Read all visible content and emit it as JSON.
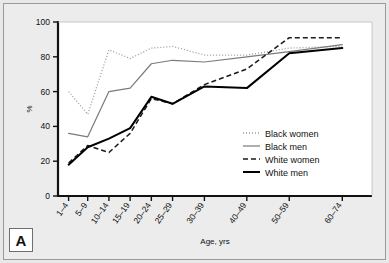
{
  "figure": {
    "panel_label": "A",
    "background_color": "#ececec",
    "plot_background_color": "#ffffff"
  },
  "chart_data": {
    "type": "line",
    "title": "",
    "xlabel": "Age, yrs",
    "ylabel": "%",
    "categories": [
      "1–4",
      "5–9",
      "10–14",
      "15–19",
      "20–24",
      "25–29",
      "30–39",
      "40–49",
      "50–59",
      "60–74"
    ],
    "x_positions": [
      2.5,
      7,
      12,
      17,
      22,
      27,
      34.5,
      44.5,
      54.5,
      67
    ],
    "xlim": [
      0,
      74
    ],
    "ylim": [
      0,
      100
    ],
    "yticks": [
      0,
      20,
      40,
      60,
      80,
      100
    ],
    "grid": false,
    "legend_position": "inside-right",
    "series": [
      {
        "name": "Black women",
        "style": "dotted",
        "color": "#9b9b9b",
        "width": 1.3,
        "values": [
          60,
          47,
          84,
          79,
          85,
          86,
          81,
          81,
          85,
          86
        ]
      },
      {
        "name": "Black men",
        "style": "solid-thin",
        "color": "#7a7a7a",
        "width": 1.2,
        "values": [
          36,
          34,
          60,
          62,
          76,
          78,
          77,
          80,
          83,
          87
        ]
      },
      {
        "name": "White women",
        "style": "dashed",
        "color": "#1a1a1a",
        "width": 1.5,
        "values": [
          19,
          29,
          25,
          36,
          56,
          53,
          64,
          73,
          91,
          91
        ]
      },
      {
        "name": "White men",
        "style": "solid-thick",
        "color": "#000000",
        "width": 2.0,
        "values": [
          18,
          28,
          33,
          39,
          57,
          53,
          63,
          62,
          82,
          85
        ]
      }
    ]
  },
  "legend": {
    "items": [
      {
        "label": "Black women"
      },
      {
        "label": "Black men"
      },
      {
        "label": "White women"
      },
      {
        "label": "White men"
      }
    ]
  }
}
